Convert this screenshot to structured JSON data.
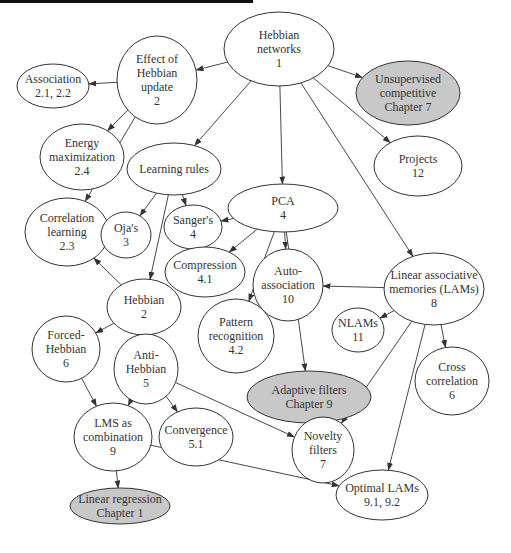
{
  "colors": {
    "stroke": "#333333",
    "node_fill": "#ffffff",
    "highlight_fill": "#c8c8c8",
    "text": "#333333",
    "top_bar": "#111111"
  },
  "nodes": [
    {
      "id": "hebbian-networks",
      "lines": [
        "Hebbian",
        "networks",
        "1"
      ],
      "cx": 279,
      "cy": 49,
      "rx": 55,
      "ry": 37,
      "shaded": false
    },
    {
      "id": "effect-of-hebbian-update",
      "lines": [
        "Effect of",
        "Hebbian",
        "update",
        "2"
      ],
      "cx": 157,
      "cy": 80,
      "rx": 40,
      "ry": 44,
      "shaded": false
    },
    {
      "id": "association",
      "lines": [
        "Association",
        "2.1, 2.2"
      ],
      "cx": 53,
      "cy": 86,
      "rx": 36,
      "ry": 22,
      "shaded": false
    },
    {
      "id": "unsupervised-competitive",
      "lines": [
        "Unsupervised",
        "competitive",
        "Chapter 7"
      ],
      "cx": 408,
      "cy": 93,
      "rx": 52,
      "ry": 32,
      "shaded": true
    },
    {
      "id": "energy-maximization",
      "lines": [
        "Energy",
        "maximization",
        "2.4"
      ],
      "cx": 82,
      "cy": 157,
      "rx": 42,
      "ry": 33,
      "shaded": false
    },
    {
      "id": "learning-rules",
      "lines": [
        "Learning rules"
      ],
      "cx": 174,
      "cy": 169,
      "rx": 47,
      "ry": 26,
      "shaded": false
    },
    {
      "id": "projects",
      "lines": [
        "Projects",
        "12"
      ],
      "cx": 418,
      "cy": 166,
      "rx": 44,
      "ry": 30,
      "shaded": false
    },
    {
      "id": "correlation-learning",
      "lines": [
        "Correlation",
        "learning",
        "2.3"
      ],
      "cx": 67,
      "cy": 232,
      "rx": 42,
      "ry": 34,
      "shaded": false
    },
    {
      "id": "ojas",
      "lines": [
        "Oja's",
        "3"
      ],
      "cx": 126,
      "cy": 235,
      "rx": 25,
      "ry": 23,
      "shaded": false
    },
    {
      "id": "sangers",
      "lines": [
        "Sanger's",
        "4"
      ],
      "cx": 193,
      "cy": 227,
      "rx": 29,
      "ry": 22,
      "shaded": false
    },
    {
      "id": "pca",
      "lines": [
        "PCA",
        "4"
      ],
      "cx": 283,
      "cy": 208,
      "rx": 55,
      "ry": 24,
      "shaded": false
    },
    {
      "id": "compression",
      "lines": [
        "Compression",
        "4.1"
      ],
      "cx": 205,
      "cy": 272,
      "rx": 40,
      "ry": 25,
      "shaded": false
    },
    {
      "id": "auto-association",
      "lines": [
        "Auto-",
        "association",
        "10"
      ],
      "cx": 288,
      "cy": 285,
      "rx": 35,
      "ry": 36,
      "shaded": false
    },
    {
      "id": "linear-associative-memories",
      "lines": [
        "Linear associative",
        "memories (LAMs)",
        "8"
      ],
      "cx": 434,
      "cy": 289,
      "rx": 50,
      "ry": 36,
      "shaded": false
    },
    {
      "id": "pattern-recognition",
      "lines": [
        "Pattern",
        "recognition",
        "4.2"
      ],
      "cx": 236,
      "cy": 336,
      "rx": 38,
      "ry": 37,
      "shaded": false
    },
    {
      "id": "nlams",
      "lines": [
        "NLAMs",
        "11"
      ],
      "cx": 358,
      "cy": 330,
      "rx": 26,
      "ry": 22,
      "shaded": false
    },
    {
      "id": "cross-correlation",
      "lines": [
        "Cross",
        "correlation",
        "6"
      ],
      "cx": 452,
      "cy": 381,
      "rx": 37,
      "ry": 34,
      "shaded": false
    },
    {
      "id": "hebbian",
      "lines": [
        "Hebbian",
        "2"
      ],
      "cx": 144,
      "cy": 307,
      "rx": 37,
      "ry": 28,
      "shaded": false
    },
    {
      "id": "forced-hebbian",
      "lines": [
        "Forced-",
        "Hebbian",
        "6"
      ],
      "cx": 66,
      "cy": 349,
      "rx": 34,
      "ry": 33,
      "shaded": false
    },
    {
      "id": "anti-hebbian",
      "lines": [
        "Anti-",
        "Hebbian",
        "5"
      ],
      "cx": 146,
      "cy": 369,
      "rx": 32,
      "ry": 35,
      "shaded": false
    },
    {
      "id": "adaptive-filters",
      "lines": [
        "Adaptive filters",
        "Chapter 9"
      ],
      "cx": 309,
      "cy": 397,
      "rx": 62,
      "ry": 26,
      "shaded": true
    },
    {
      "id": "convergence",
      "lines": [
        "Convergence",
        "5.1"
      ],
      "cx": 196,
      "cy": 437,
      "rx": 37,
      "ry": 29,
      "shaded": false
    },
    {
      "id": "lms-as-combination",
      "lines": [
        "LMS as",
        "combination",
        "9"
      ],
      "cx": 113,
      "cy": 437,
      "rx": 39,
      "ry": 34,
      "shaded": false
    },
    {
      "id": "novelty-filters",
      "lines": [
        "Novelty",
        "filters",
        "7"
      ],
      "cx": 323,
      "cy": 450,
      "rx": 31,
      "ry": 33,
      "shaded": false
    },
    {
      "id": "optimal-lams",
      "lines": [
        "Optimal LAMs",
        "9.1, 9.2"
      ],
      "cx": 382,
      "cy": 495,
      "rx": 46,
      "ry": 25,
      "shaded": false
    },
    {
      "id": "linear-regression",
      "lines": [
        "Linear regression",
        "Chapter 1"
      ],
      "cx": 120,
      "cy": 506,
      "rx": 50,
      "ry": 18,
      "shaded": true
    }
  ],
  "edges": [
    {
      "from": "hebbian-networks",
      "to": "effect-of-hebbian-update"
    },
    {
      "from": "hebbian-networks",
      "to": "unsupervised-competitive"
    },
    {
      "from": "hebbian-networks",
      "to": "learning-rules"
    },
    {
      "from": "hebbian-networks",
      "to": "pca"
    },
    {
      "from": "hebbian-networks",
      "to": "projects"
    },
    {
      "from": "hebbian-networks",
      "to": "linear-associative-memories"
    },
    {
      "from": "effect-of-hebbian-update",
      "to": "association"
    },
    {
      "from": "effect-of-hebbian-update",
      "to": "energy-maximization"
    },
    {
      "from": "effect-of-hebbian-update",
      "to": "correlation-learning"
    },
    {
      "from": "learning-rules",
      "to": "ojas"
    },
    {
      "from": "learning-rules",
      "to": "sangers"
    },
    {
      "from": "learning-rules",
      "to": "hebbian"
    },
    {
      "from": "pca",
      "to": "sangers"
    },
    {
      "from": "pca",
      "to": "compression"
    },
    {
      "from": "pca",
      "to": "pattern-recognition"
    },
    {
      "from": "pca",
      "to": "auto-association"
    },
    {
      "from": "pca",
      "to": "adaptive-filters"
    },
    {
      "from": "linear-associative-memories",
      "to": "auto-association"
    },
    {
      "from": "linear-associative-memories",
      "to": "nlams"
    },
    {
      "from": "linear-associative-memories",
      "to": "cross-correlation"
    },
    {
      "from": "linear-associative-memories",
      "to": "novelty-filters"
    },
    {
      "from": "linear-associative-memories",
      "to": "optimal-lams"
    },
    {
      "from": "hebbian",
      "to": "correlation-learning"
    },
    {
      "from": "hebbian",
      "to": "forced-hebbian"
    },
    {
      "from": "hebbian",
      "to": "anti-hebbian"
    },
    {
      "from": "forced-hebbian",
      "to": "lms-as-combination"
    },
    {
      "from": "anti-hebbian",
      "to": "lms-as-combination"
    },
    {
      "from": "anti-hebbian",
      "to": "convergence"
    },
    {
      "from": "anti-hebbian",
      "to": "novelty-filters"
    },
    {
      "from": "novelty-filters",
      "to": "adaptive-filters"
    },
    {
      "from": "lms-as-combination",
      "to": "linear-regression"
    },
    {
      "from": "lms-as-combination",
      "to": "optimal-lams"
    }
  ]
}
